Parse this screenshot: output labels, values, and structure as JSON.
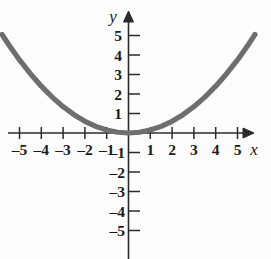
{
  "chart_data": {
    "type": "line",
    "title": "",
    "subtitle": "",
    "xlabel": "x",
    "ylabel": "y",
    "xlim": [
      -6.2,
      6.5
    ],
    "ylim": [
      -6.3,
      5.7
    ],
    "grid": false,
    "legend": null,
    "annotations": [],
    "axis_style": {
      "x_axis_arrow": "right",
      "y_axis_arrow": "up",
      "axis_color": "#2b2b2b",
      "curve_color": "#6e6e6e"
    },
    "xticks": [
      -5,
      -4,
      -3,
      -2,
      -1,
      1,
      2,
      3,
      4,
      5
    ],
    "xticklabels": [
      "–5",
      "–4",
      "–3",
      "–2",
      "–1",
      "1",
      "2",
      "3",
      "4",
      "5"
    ],
    "yticks": [
      5,
      4,
      3,
      2,
      1,
      -1,
      -2,
      -3,
      -4,
      -5
    ],
    "yticklabels": [
      "5",
      "4",
      "3",
      "2",
      "1",
      "–1",
      "–2",
      "–3",
      "–4",
      "–5"
    ],
    "series": [
      {
        "name": "parabola",
        "equation": "y = 0.15x^2",
        "color": "#6e6e6e",
        "x": [
          -5.8,
          -5.5,
          -5.0,
          -4.5,
          -4.0,
          -3.5,
          -3.0,
          -2.5,
          -2.0,
          -1.5,
          -1.0,
          -0.5,
          0.0,
          0.5,
          1.0,
          1.5,
          2.0,
          2.5,
          3.0,
          3.5,
          4.0,
          4.5,
          5.0,
          5.5,
          5.8
        ],
        "y": [
          5.05,
          4.54,
          3.75,
          3.04,
          2.4,
          1.84,
          1.35,
          0.94,
          0.6,
          0.34,
          0.15,
          0.04,
          0.0,
          0.04,
          0.15,
          0.34,
          0.6,
          0.94,
          1.35,
          1.84,
          2.4,
          3.04,
          3.75,
          4.54,
          5.05
        ]
      }
    ]
  },
  "labels": {
    "x_axis": "x",
    "y_axis": "y"
  }
}
